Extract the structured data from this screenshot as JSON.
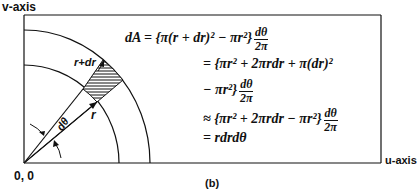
{
  "axes": {
    "v_label": "v-axis",
    "u_label": "u-axis",
    "origin_label": "0, 0"
  },
  "diagram": {
    "inner_radius_label": "r",
    "outer_radius_label": "r+dr",
    "angle_label": "dθ",
    "shaded_element": "differential area element dA (hatched)"
  },
  "equation": {
    "line1_lhs": "dA = {π(r + dr)² − πr²}",
    "line1_frac_num": "dθ",
    "line1_frac_den": "2π",
    "line2": "= {πr² + 2πrdr + π(dr)²",
    "line3": "− πr²}",
    "line3_frac_num": "dθ",
    "line3_frac_den": "2π",
    "line4": "≈ {πr² + 2πrdr − πr²}",
    "line4_frac_num": "dθ",
    "line4_frac_den": "2π",
    "line5": "= rdrdθ"
  },
  "caption": "(b)",
  "colors": {
    "line": "#111111",
    "background": "#ffffff"
  }
}
